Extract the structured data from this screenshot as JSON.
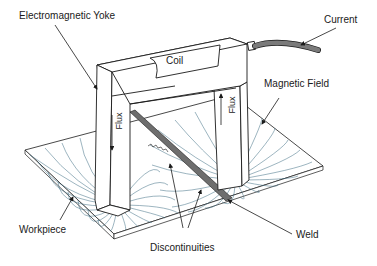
{
  "diagram": {
    "labels": {
      "yoke": "Electromagnetic Yoke",
      "current": "Current",
      "coil": "Coil",
      "magnetic_field": "Magnetic Field",
      "flux_left": "Flux",
      "flux_right": "Flux",
      "workpiece": "Workpiece",
      "discontinuities": "Discontinuities",
      "weld": "Weld"
    },
    "colors": {
      "line": "#1a1a1a",
      "field_lines": "#3b6a80",
      "cable": "#7a7a7a",
      "weld": "#6e6e6e"
    }
  }
}
